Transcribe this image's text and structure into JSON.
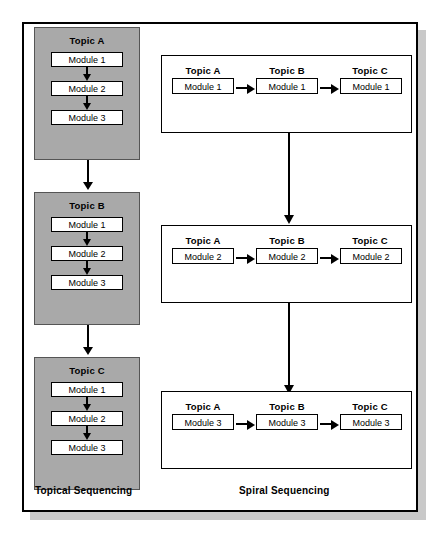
{
  "diagram": {
    "colors": {
      "topic_group_fill": "#a9a9a9",
      "topic_group_border": "#555555",
      "module_fill": "#ffffff",
      "line": "#000000",
      "frame_border": "#000000",
      "frame_shadow": "#c9c9c9",
      "background": "#ffffff"
    },
    "left_panel": {
      "caption": "Topical Sequencing",
      "topic_groups": [
        {
          "title": "Topic A",
          "modules": [
            "Module 1",
            "Module 2",
            "Module 3"
          ]
        },
        {
          "title": "Topic B",
          "modules": [
            "Module 1",
            "Module 2",
            "Module 3"
          ]
        },
        {
          "title": "Topic C",
          "modules": [
            "Module 1",
            "Module 2",
            "Module 3"
          ]
        }
      ],
      "connectors": [
        "down-arrow",
        "down-arrow"
      ]
    },
    "right_panel": {
      "caption": "Spiral Sequencing",
      "rows": [
        {
          "topics": [
            "Topic A",
            "Topic B",
            "Topic C"
          ],
          "modules": [
            "Module 1",
            "Module 1",
            "Module 1"
          ]
        },
        {
          "topics": [
            "Topic A",
            "Topic B",
            "Topic C"
          ],
          "modules": [
            "Module 2",
            "Module 2",
            "Module 2"
          ]
        },
        {
          "topics": [
            "Topic A",
            "Topic B",
            "Topic C"
          ],
          "modules": [
            "Module 3",
            "Module 3",
            "Module 3"
          ]
        }
      ],
      "connectors": [
        "down-arrow",
        "down-arrow"
      ]
    }
  }
}
